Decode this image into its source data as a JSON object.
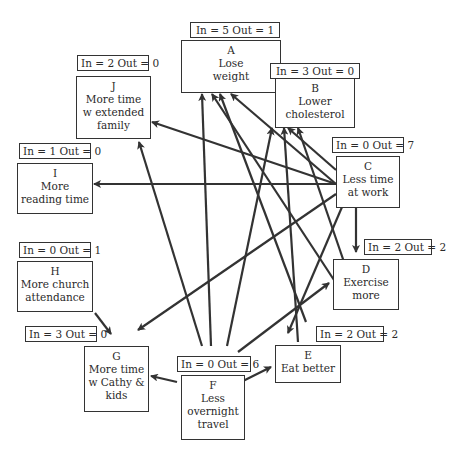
{
  "nodes": {
    "A": {
      "letter": "A",
      "label": "Lose\nweight",
      "badge": "In = 5  Out = 1"
    },
    "B": {
      "letter": "B",
      "label": "Lower\ncholesterol",
      "badge": "In = 3  Out = 0"
    },
    "C": {
      "letter": "C",
      "label": "Less time\nat work",
      "badge": "In = 0  Out = 7"
    },
    "D": {
      "letter": "D",
      "label": "Exercise\nmore",
      "badge": "In = 2  Out = 2"
    },
    "E": {
      "letter": "E",
      "label": "Eat better",
      "badge": "In = 2  Out = 2"
    },
    "F": {
      "letter": "F",
      "label": "Less\novernight\ntravel",
      "badge": "In = 0  Out = 6"
    },
    "G": {
      "letter": "G",
      "label": "More time\nw Cathy &\nkids",
      "badge": "In = 3  Out = 0"
    },
    "H": {
      "letter": "H",
      "label": "More church\nattendance",
      "badge": "In = 0  Out = 1"
    },
    "I": {
      "letter": "I",
      "label": "More\nreading time",
      "badge": "In = 1  Out = 0"
    },
    "J": {
      "letter": "J",
      "label": "More time\nw extended\nfamily",
      "badge": "In = 2  Out = 0"
    }
  },
  "edges": [
    {
      "from": "A",
      "to": "B"
    },
    {
      "from": "C",
      "to": "J"
    },
    {
      "from": "C",
      "to": "I"
    },
    {
      "from": "C",
      "to": "A"
    },
    {
      "from": "C",
      "to": "B"
    },
    {
      "from": "C",
      "to": "D"
    },
    {
      "from": "C",
      "to": "G"
    },
    {
      "from": "C",
      "to": "E"
    },
    {
      "from": "D",
      "to": "A"
    },
    {
      "from": "D",
      "to": "B"
    },
    {
      "from": "E",
      "to": "A"
    },
    {
      "from": "E",
      "to": "B"
    },
    {
      "from": "F",
      "to": "J"
    },
    {
      "from": "F",
      "to": "A"
    },
    {
      "from": "F",
      "to": "A"
    },
    {
      "from": "F",
      "to": "D"
    },
    {
      "from": "F",
      "to": "E"
    },
    {
      "from": "F",
      "to": "G"
    },
    {
      "from": "H",
      "to": "G"
    }
  ],
  "colors": {
    "line": "#333333",
    "box_border": "#333333",
    "background": "#ffffff"
  }
}
